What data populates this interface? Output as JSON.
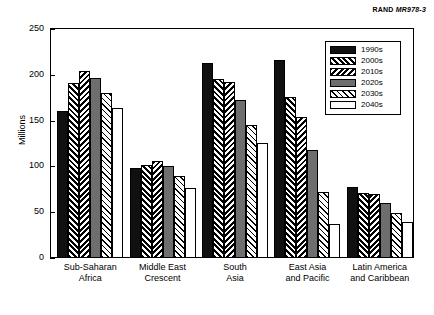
{
  "source_id": {
    "prefix": "RAND",
    "code": "MR978-3"
  },
  "chart_data": {
    "type": "bar",
    "title": "",
    "xlabel": "",
    "ylabel": "Millions",
    "ylim": [
      0,
      250
    ],
    "yticks": [
      0,
      50,
      100,
      150,
      200,
      250
    ],
    "grid": false,
    "legend_position": "top-right",
    "categories": [
      "Sub-Saharan Africa",
      "Middle East Crescent",
      "South Asia",
      "East Asia and Pacific",
      "Latin America and Caribbean"
    ],
    "category_lines": [
      [
        "Sub-Saharan",
        "Africa"
      ],
      [
        "Middle East",
        "Crescent"
      ],
      [
        "South",
        "Asia"
      ],
      [
        "East Asia",
        "and Pacific"
      ],
      [
        "Latin America",
        "and Caribbean"
      ]
    ],
    "series": [
      {
        "name": "1990s",
        "pattern": "solid-black",
        "values": [
          160,
          98,
          213,
          216,
          78
        ]
      },
      {
        "name": "2000s",
        "pattern": "hatch-forward",
        "values": [
          191,
          101,
          195,
          176,
          71
        ]
      },
      {
        "name": "2010s",
        "pattern": "hatch-backward",
        "values": [
          204,
          106,
          192,
          154,
          70
        ]
      },
      {
        "name": "2020s",
        "pattern": "solid-gray",
        "values": [
          197,
          100,
          172,
          118,
          60
        ]
      },
      {
        "name": "2030s",
        "pattern": "hatch-sparse",
        "values": [
          180,
          90,
          145,
          72,
          49
        ]
      },
      {
        "name": "2040s",
        "pattern": "white",
        "values": [
          164,
          76,
          126,
          37,
          39
        ]
      }
    ]
  },
  "legend": {
    "items": [
      {
        "label": "1990s"
      },
      {
        "label": "2000s"
      },
      {
        "label": "2010s"
      },
      {
        "label": "2020s"
      },
      {
        "label": "2030s"
      },
      {
        "label": "2040s"
      }
    ]
  }
}
